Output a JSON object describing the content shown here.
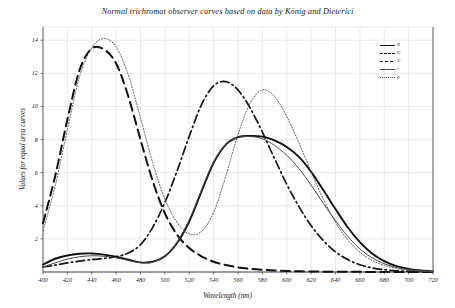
{
  "chart_data": {
    "type": "line",
    "title": "Normal trichromat observer curves based on data by König and Dieterici",
    "xlabel": "Wavelength (nm)",
    "ylabel": "Values for equal area curves",
    "xlim": [
      400,
      720
    ],
    "ylim": [
      0,
      14.8
    ],
    "xticks": [
      400,
      420,
      440,
      460,
      480,
      500,
      520,
      540,
      560,
      580,
      600,
      620,
      640,
      660,
      680,
      700,
      720
    ],
    "yticks": [
      2,
      4,
      6,
      8,
      10,
      12,
      14
    ],
    "grid": true,
    "legend_position": "top-right",
    "x": [
      400,
      410,
      420,
      430,
      440,
      450,
      460,
      470,
      480,
      490,
      500,
      510,
      520,
      530,
      540,
      550,
      560,
      570,
      580,
      590,
      600,
      610,
      620,
      630,
      640,
      650,
      660,
      670,
      680,
      690,
      700,
      710,
      720
    ],
    "series": [
      {
        "name": "R",
        "label": "R",
        "style": "solid-thick",
        "color": "#111111",
        "width": 1.9,
        "values": [
          0.45,
          0.8,
          1.0,
          1.1,
          1.12,
          1.05,
          0.92,
          0.74,
          0.58,
          0.62,
          0.95,
          1.75,
          3.05,
          4.85,
          6.6,
          7.7,
          8.15,
          8.22,
          8.18,
          7.95,
          7.55,
          6.95,
          6.05,
          4.95,
          3.8,
          2.7,
          1.8,
          1.12,
          0.66,
          0.36,
          0.19,
          0.09,
          0.04
        ]
      },
      {
        "name": "G",
        "label": "G",
        "style": "dash-dot",
        "color": "#151515",
        "width": 1.7,
        "values": [
          0.3,
          0.42,
          0.55,
          0.66,
          0.75,
          0.82,
          0.92,
          1.15,
          1.65,
          2.7,
          4.2,
          6.1,
          8.2,
          10.1,
          11.25,
          11.5,
          11.0,
          9.9,
          8.45,
          6.85,
          5.3,
          3.95,
          2.8,
          1.9,
          1.22,
          0.75,
          0.44,
          0.25,
          0.14,
          0.07,
          0.04,
          0.02,
          0.01
        ]
      },
      {
        "name": "V",
        "label": "V",
        "style": "dashed",
        "color": "#111111",
        "width": 2.0,
        "values": [
          2.95,
          5.8,
          9.2,
          12.2,
          13.5,
          13.45,
          12.6,
          10.6,
          8.0,
          5.5,
          3.55,
          2.25,
          1.45,
          0.95,
          0.62,
          0.42,
          0.28,
          0.19,
          0.13,
          0.09,
          0.06,
          0.04,
          0.03,
          0.02,
          0.015,
          0.01,
          0.008,
          0.005,
          0.004,
          0.003,
          0.002,
          0.001,
          0.001
        ]
      },
      {
        "name": "r",
        "label": "r",
        "style": "solid-thin",
        "color": "#4a4a4a",
        "width": 1.0,
        "values": [
          0.3,
          0.55,
          0.78,
          0.92,
          0.98,
          0.95,
          0.86,
          0.7,
          0.56,
          0.6,
          0.95,
          1.8,
          3.15,
          4.95,
          6.65,
          7.7,
          8.12,
          8.18,
          8.05,
          7.65,
          7.05,
          6.25,
          5.25,
          4.15,
          3.1,
          2.15,
          1.4,
          0.86,
          0.5,
          0.27,
          0.14,
          0.07,
          0.03
        ]
      },
      {
        "name": "g",
        "label": "g",
        "style": "dotted",
        "color": "#5a5a5a",
        "width": 1.0,
        "values": [
          2.5,
          5.2,
          8.6,
          11.8,
          13.55,
          14.1,
          13.6,
          11.9,
          9.3,
          6.6,
          4.4,
          3.0,
          2.3,
          2.45,
          3.6,
          5.8,
          8.3,
          10.2,
          11.0,
          10.6,
          9.4,
          7.8,
          6.05,
          4.4,
          3.0,
          1.95,
          1.2,
          0.7,
          0.4,
          0.21,
          0.11,
          0.05,
          0.02
        ]
      }
    ],
    "legend": [
      {
        "label": "R",
        "style": "solid-thick"
      },
      {
        "label": "G",
        "style": "dashed"
      },
      {
        "label": "V",
        "style": "dash-dot"
      },
      {
        "label": "r",
        "style": "solid-thin"
      },
      {
        "label": "g",
        "style": "dotted"
      }
    ]
  },
  "colors": {
    "axis": "#3a3a3a",
    "grid": "#d7d7d7",
    "curve": "#111111",
    "background": "#ffffff"
  }
}
